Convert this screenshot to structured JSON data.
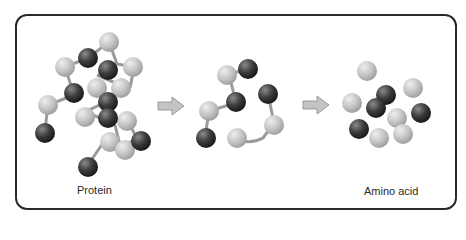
{
  "labels": {
    "protein": "Protein",
    "amino_acid": "Amino acid"
  },
  "colors": {
    "light_ball": "#c8c8c8",
    "dark_ball": "#3a3a3a",
    "bond": "#9a9a9a",
    "arrow": "#c4c4c4",
    "border": "#2a2a2a"
  }
}
